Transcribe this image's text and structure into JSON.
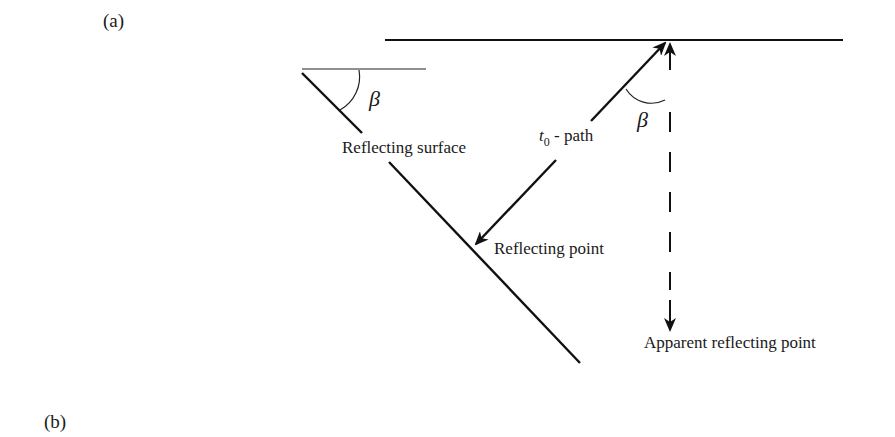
{
  "panels": {
    "a_label": "(a)",
    "b_label": "(b)"
  },
  "labels": {
    "reflecting_surface": "Reflecting surface",
    "t0_symbol": "t",
    "t0_subscript": "0",
    "t0_path_suffix": "- path",
    "reflecting_point": "Reflecting point",
    "apparent_reflecting_point": "Apparent reflecting point",
    "beta_left": "β",
    "beta_right": "β"
  },
  "colors": {
    "line": "#111111",
    "background": "#ffffff"
  }
}
